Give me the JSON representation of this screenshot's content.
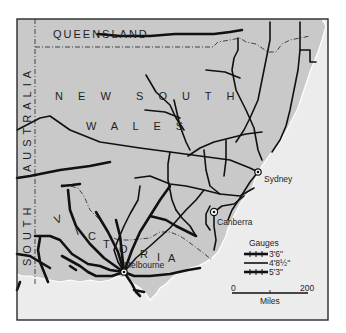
{
  "map": {
    "title": "Railway gauges of south-eastern Australia",
    "regions": {
      "queensland": "QUEENSLAND",
      "nsw_line1": "N E W",
      "nsw_line2": "S O U T H",
      "nsw_line3": "W A L E S",
      "victoria_v": "V",
      "victoria_i": "I",
      "victoria_c": "C",
      "victoria_t": "T",
      "victoria_o": "O",
      "victoria_r": "R",
      "victoria_i2": "I",
      "victoria_a": "A",
      "south_australia_1": "AUSTRALIA",
      "south_australia_2": "SOUTH"
    },
    "cities": [
      {
        "name": "Sydney"
      },
      {
        "name": "Canberra"
      },
      {
        "name": "Melbourne"
      }
    ],
    "legend": {
      "title": "Gauges",
      "items": [
        {
          "label": "3'6\"",
          "style": "thick-barred"
        },
        {
          "label": "4'8½\"",
          "style": "thin"
        },
        {
          "label": "5'3\"",
          "style": "thick-barred"
        }
      ]
    },
    "scale": {
      "start": "0",
      "end": "200",
      "unit": "Miles"
    },
    "colors": {
      "land": "#c9c9c9",
      "sea": "#ececec",
      "outer": "#ffffff",
      "rail": "#111111",
      "frame": "#2a2a2a"
    }
  }
}
